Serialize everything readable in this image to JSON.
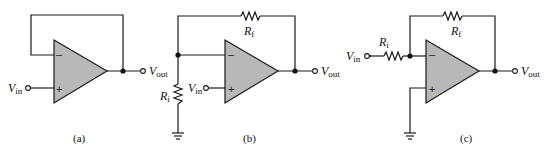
{
  "figure": {
    "circuits": [
      {
        "id": "a",
        "caption": "(a)",
        "description": "Voltage follower (unity-gain buffer)",
        "input_label": {
          "main": "V",
          "sub": "in"
        },
        "output_label": {
          "main": "V",
          "sub": "out"
        },
        "minus_sign": "–",
        "plus_sign": "+"
      },
      {
        "id": "b",
        "caption": "(b)",
        "description": "Non-inverting amplifier",
        "input_label": {
          "main": "V",
          "sub": "in"
        },
        "output_label": {
          "main": "V",
          "sub": "out"
        },
        "feedback_resistor": {
          "main": "R",
          "sub": "f"
        },
        "input_resistor": {
          "main": "R",
          "sub": "i"
        },
        "minus_sign": "–",
        "plus_sign": "+"
      },
      {
        "id": "c",
        "caption": "(c)",
        "description": "Inverting amplifier",
        "input_label": {
          "main": "V",
          "sub": "in"
        },
        "output_label": {
          "main": "V",
          "sub": "out"
        },
        "feedback_resistor": {
          "main": "R",
          "sub": "f"
        },
        "input_resistor": {
          "main": "R",
          "sub": "i"
        },
        "minus_sign": "–",
        "plus_sign": "+"
      }
    ],
    "colors": {
      "amp_fill": "#b8b8b8",
      "line": "#1a1a1a"
    }
  }
}
